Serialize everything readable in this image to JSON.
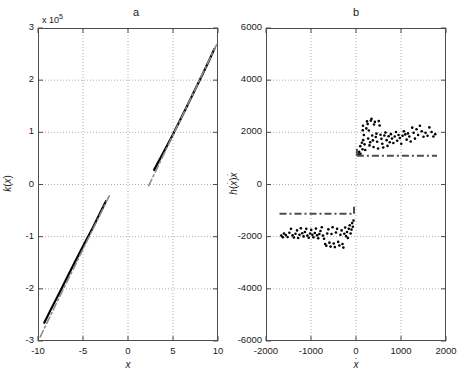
{
  "figure": {
    "width": 462,
    "height": 390,
    "background": "#ffffff"
  },
  "panels": [
    {
      "id": "panel-a",
      "title": "a",
      "exponent_label": "x 10",
      "exponent_value": "5",
      "xlabel": "x",
      "ylabel": "k(x)",
      "xticks": [
        "-10",
        "-5",
        "0",
        "5",
        "10"
      ],
      "xtick_values": [
        -10,
        -5,
        0,
        5,
        10
      ],
      "yticks": [
        "3",
        "2",
        "1",
        "0",
        "-1",
        "-2",
        "-3"
      ],
      "ytick_values": [
        3,
        2,
        1,
        0,
        -1,
        -2,
        -3
      ],
      "xlim": [
        -10,
        10
      ],
      "ylim": [
        -3,
        3
      ]
    },
    {
      "id": "panel-b",
      "title": "b",
      "xlabel": "x",
      "ylabel": "h(x)x",
      "xticks": [
        "-2000",
        "-1000",
        "0",
        "1000",
        "2000"
      ],
      "xtick_values": [
        -2000,
        -1000,
        0,
        1000,
        2000
      ],
      "yticks": [
        "6000",
        "4000",
        "2000",
        "0",
        "-2000",
        "-4000",
        "-6000"
      ],
      "ytick_values": [
        6000,
        4000,
        2000,
        0,
        -2000,
        -4000,
        -6000
      ],
      "xlim": [
        -2000,
        2000
      ],
      "ylim": [
        -6000,
        6000
      ]
    }
  ],
  "colors": {
    "solid_curve": "#000000",
    "dashed_curve": "#8c8c8c",
    "axis": "#4d4d4d",
    "grid": "#9a9a9a",
    "marker": "#000000",
    "text": "#1a1a1a"
  },
  "chart_data": [
    {
      "type": "line",
      "title": "a",
      "xlabel": "x",
      "ylabel": "k(x)",
      "xlim": [
        -10,
        10
      ],
      "ylim": [
        -300000,
        300000
      ],
      "y_exponent": 100000,
      "grid": true,
      "legend": null,
      "series": [
        {
          "name": "k(x) identified (solid black)",
          "style": "solid",
          "color": "#000000",
          "segments": [
            {
              "x": [
                -9.3,
                -8.5,
                -7.6,
                -6.7,
                -5.8,
                -4.9,
                -4.0,
                -3.2,
                -2.45
              ],
              "y": [
                -265000,
                -237000,
                -207000,
                -176000,
                -145000,
                -115000,
                -86000,
                -58000,
                -32000
              ]
            },
            {
              "x": [
                2.9,
                3.8,
                4.7,
                5.6,
                6.5,
                7.4,
                8.3,
                9.1,
                9.6
              ],
              "y": [
                28000,
                57000,
                86000,
                117000,
                148000,
                180000,
                212000,
                241000,
                260000
              ]
            }
          ]
        },
        {
          "name": "k(x) reference (dash-dot grey)",
          "style": "dashdot",
          "color": "#8c8c8c",
          "segments": [
            {
              "x": [
                -9.75,
                -8.8,
                -7.8,
                -6.8,
                -5.8,
                -4.8,
                -3.8,
                -2.8,
                -1.95
              ],
              "y": [
                -292000,
                -258000,
                -222000,
                -187000,
                -152000,
                -117000,
                -82000,
                -47000,
                -17000
              ]
            },
            {
              "x": [
                2.3,
                3.2,
                4.2,
                5.2,
                6.2,
                7.2,
                8.2,
                9.2,
                9.85
              ],
              "y": [
                -2000,
                30000,
                66000,
                102000,
                137000,
                173000,
                209000,
                245000,
                268000
              ]
            }
          ]
        }
      ]
    },
    {
      "type": "scatter",
      "title": "b",
      "xlabel": "x",
      "ylabel": "h(x)x",
      "xlim": [
        -2000,
        2000
      ],
      "ylim": [
        -6000,
        6000
      ],
      "grid": true,
      "legend": null,
      "series": [
        {
          "name": "upper cluster (identified friction, black dots)",
          "style": "markers",
          "color": "#000000",
          "points": [
            [
              60,
              1150
            ],
            [
              70,
              1250
            ],
            [
              95,
              1470
            ],
            [
              100,
              1180
            ],
            [
              130,
              1600
            ],
            [
              145,
              1350
            ],
            [
              150,
              2080
            ],
            [
              155,
              2250
            ],
            [
              160,
              1700
            ],
            [
              175,
              1900
            ],
            [
              190,
              1540
            ],
            [
              205,
              1320
            ],
            [
              230,
              2150
            ],
            [
              245,
              2420
            ],
            [
              260,
              2320
            ],
            [
              270,
              1760
            ],
            [
              285,
              2070
            ],
            [
              300,
              1500
            ],
            [
              315,
              1620
            ],
            [
              330,
              2450
            ],
            [
              345,
              2520
            ],
            [
              360,
              1880
            ],
            [
              375,
              1690
            ],
            [
              390,
              1440
            ],
            [
              400,
              2300
            ],
            [
              420,
              2400
            ],
            [
              440,
              1820
            ],
            [
              455,
              1950
            ],
            [
              470,
              1640
            ],
            [
              490,
              1380
            ],
            [
              505,
              2430
            ],
            [
              525,
              2260
            ],
            [
              545,
              1910
            ],
            [
              565,
              1750
            ],
            [
              585,
              1560
            ],
            [
              605,
              1420
            ],
            [
              630,
              1880
            ],
            [
              655,
              1990
            ],
            [
              680,
              1700
            ],
            [
              700,
              1480
            ],
            [
              725,
              1850
            ],
            [
              750,
              1620
            ],
            [
              775,
              1930
            ],
            [
              800,
              1760
            ],
            [
              830,
              1590
            ],
            [
              860,
              1840
            ],
            [
              890,
              2010
            ],
            [
              915,
              1680
            ],
            [
              945,
              1900
            ],
            [
              975,
              1780
            ],
            [
              1005,
              1560
            ],
            [
              1035,
              1870
            ],
            [
              1065,
              2040
            ],
            [
              1095,
              1920
            ],
            [
              1125,
              1720
            ],
            [
              1155,
              1960
            ],
            [
              1185,
              1840
            ],
            [
              1215,
              1650
            ],
            [
              1250,
              2180
            ],
            [
              1280,
              1980
            ],
            [
              1310,
              1760
            ],
            [
              1345,
              2120
            ],
            [
              1380,
              1900
            ],
            [
              1420,
              2250
            ],
            [
              1460,
              2040
            ],
            [
              1500,
              1830
            ],
            [
              1545,
              1980
            ],
            [
              1590,
              1870
            ],
            [
              1630,
              2190
            ],
            [
              1680,
              2010
            ],
            [
              1720,
              1840
            ],
            [
              1760,
              1930
            ]
          ]
        },
        {
          "name": "lower cluster (identified friction, black dots)",
          "style": "markers",
          "color": "#000000",
          "points": [
            [
              -1660,
              -1960
            ],
            [
              -1625,
              -2020
            ],
            [
              -1600,
              -1880
            ],
            [
              -1560,
              -1940
            ],
            [
              -1520,
              -2010
            ],
            [
              -1480,
              -1850
            ],
            [
              -1445,
              -1700
            ],
            [
              -1410,
              -1950
            ],
            [
              -1380,
              -2030
            ],
            [
              -1345,
              -1890
            ],
            [
              -1310,
              -1760
            ],
            [
              -1285,
              -2050
            ],
            [
              -1255,
              -1930
            ],
            [
              -1225,
              -1680
            ],
            [
              -1195,
              -1870
            ],
            [
              -1165,
              -1990
            ],
            [
              -1135,
              -1820
            ],
            [
              -1105,
              -1700
            ],
            [
              -1080,
              -1960
            ],
            [
              -1050,
              -2040
            ],
            [
              -1020,
              -1880
            ],
            [
              -995,
              -1740
            ],
            [
              -970,
              -1930
            ],
            [
              -945,
              -2020
            ],
            [
              -915,
              -1860
            ],
            [
              -890,
              -1690
            ],
            [
              -865,
              -1950
            ],
            [
              -840,
              -2060
            ],
            [
              -815,
              -1900
            ],
            [
              -790,
              -1780
            ],
            [
              -760,
              -1640
            ],
            [
              -735,
              -1960
            ],
            [
              -710,
              -2080
            ],
            [
              -685,
              -2280
            ],
            [
              -660,
              -2350
            ],
            [
              -640,
              -1880
            ],
            [
              -615,
              -1720
            ],
            [
              -590,
              -2230
            ],
            [
              -565,
              -2380
            ],
            [
              -545,
              -1900
            ],
            [
              -520,
              -1640
            ],
            [
              -495,
              -2260
            ],
            [
              -470,
              -2400
            ],
            [
              -445,
              -1840
            ],
            [
              -420,
              -1700
            ],
            [
              -395,
              -2200
            ],
            [
              -370,
              -2340
            ],
            [
              -345,
              -1930
            ],
            [
              -320,
              -1760
            ],
            [
              -300,
              -2280
            ],
            [
              -280,
              -2420
            ],
            [
              -260,
              -1890
            ],
            [
              -240,
              -1650
            ],
            [
              -220,
              -1980
            ],
            [
              -200,
              -1820
            ],
            [
              -180,
              -2050
            ],
            [
              -160,
              -1700
            ],
            [
              -140,
              -1560
            ],
            [
              -120,
              -1880
            ],
            [
              -100,
              -1730
            ],
            [
              -85,
              -1480
            ],
            [
              -70,
              -1620
            ],
            [
              -55,
              -1380
            ]
          ]
        },
        {
          "name": "upper reference level (dash-dot)",
          "style": "dashdot-line",
          "color": "#4d4d4d",
          "level": 1100,
          "x_range": [
            20,
            1800
          ]
        },
        {
          "name": "lower reference level (dash-dot)",
          "style": "dashdot-line",
          "color": "#4d4d4d",
          "level": -1120,
          "x_range": [
            -1700,
            -45
          ]
        }
      ]
    }
  ]
}
